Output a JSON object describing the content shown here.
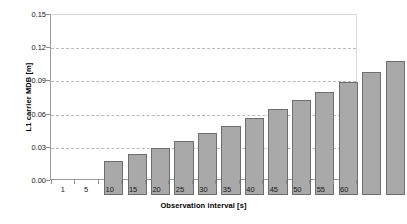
{
  "chart_data": {
    "type": "bar",
    "title": "",
    "xlabel": "Observation interval [s]",
    "ylabel": "L1 carrier MDB [m]",
    "categories": [
      "1",
      "5",
      "10",
      "15",
      "20",
      "25",
      "30",
      "35",
      "40",
      "45",
      "50",
      "55",
      "60"
    ],
    "values": [
      0.031,
      0.037,
      0.043,
      0.049,
      0.056,
      0.063,
      0.07,
      0.078,
      0.086,
      0.094,
      0.103,
      0.112,
      0.122
    ],
    "series": [
      {
        "name": "L1 carrier MDB",
        "values": [
          0.031,
          0.037,
          0.043,
          0.049,
          0.056,
          0.063,
          0.07,
          0.078,
          0.086,
          0.094,
          0.103,
          0.112,
          0.122
        ]
      }
    ],
    "ylim": [
      0.0,
      0.15
    ],
    "yticks": [
      0.0,
      0.03,
      0.06,
      0.09,
      0.12,
      0.15
    ],
    "ytick_labels": [
      "0.00",
      "0.03",
      "0.06",
      "0.09",
      "0.12",
      "0.15"
    ],
    "grid": true,
    "grid_axis": "y",
    "legend": "none",
    "bar_fill_color": "#a9a9a9",
    "bar_border_color": "#6e6e6e",
    "grid_color": "#b9b9b9",
    "axis_color": "#8d8d8d",
    "background_color": "#ffffff"
  }
}
